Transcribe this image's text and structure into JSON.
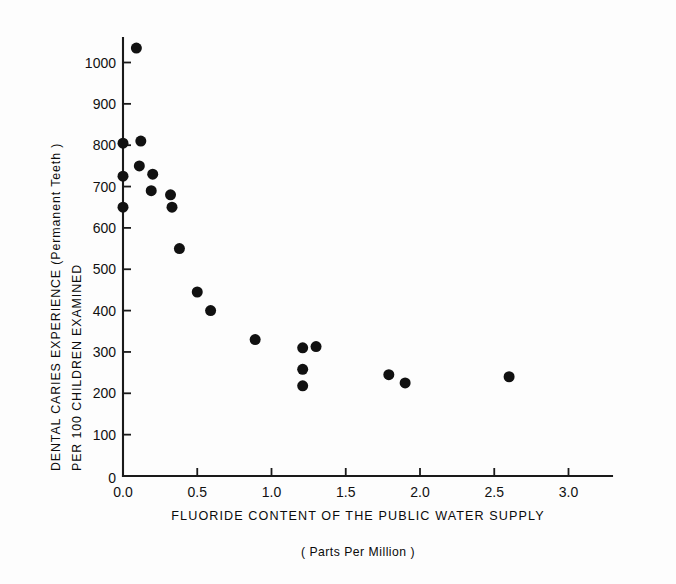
{
  "chart_data": {
    "type": "scatter",
    "title": "",
    "xlabel": "FLUORIDE CONTENT OF THE PUBLIC WATER SUPPLY",
    "xlabel_sub": "( Parts Per Million )",
    "ylabel": "DENTAL CARIES EXPERIENCE (Permanent Teeth )",
    "ylabel_sub": "PER 100 CHILDREN EXAMINED",
    "xlim": [
      0.0,
      3.28
    ],
    "ylim": [
      0,
      1075
    ],
    "grid": false,
    "legend": null,
    "xticks": [
      0.0,
      0.5,
      1.0,
      1.5,
      2.0,
      2.5,
      3.0
    ],
    "xtick_labels": [
      "0.0",
      "0.5",
      "1.0",
      "1.5",
      "2.0",
      "2.5",
      "3.0"
    ],
    "yticks": [
      0,
      100,
      200,
      300,
      400,
      500,
      600,
      700,
      800,
      900,
      1000
    ],
    "ytick_labels": [
      "0",
      "100",
      "200",
      "300",
      "400",
      "500",
      "600",
      "700",
      "800",
      "900",
      "1000"
    ],
    "marker": "filled-circle",
    "marker_color": "#111111",
    "marker_size": 11,
    "x": [
      0.09,
      0.0,
      0.12,
      0.11,
      0.0,
      0.19,
      0.2,
      0.32,
      0.0,
      0.33,
      0.38,
      0.5,
      0.59,
      0.89,
      1.21,
      1.3,
      1.21,
      1.21,
      1.79,
      1.9,
      2.6
    ],
    "y": [
      1035,
      805,
      810,
      750,
      725,
      690,
      730,
      680,
      650,
      650,
      550,
      445,
      400,
      330,
      310,
      313,
      258,
      218,
      245,
      225,
      240
    ],
    "points": [
      {
        "x": 0.09,
        "y": 1035
      },
      {
        "x": 0.0,
        "y": 805
      },
      {
        "x": 0.12,
        "y": 810
      },
      {
        "x": 0.11,
        "y": 750
      },
      {
        "x": 0.0,
        "y": 725
      },
      {
        "x": 0.19,
        "y": 690
      },
      {
        "x": 0.2,
        "y": 730
      },
      {
        "x": 0.32,
        "y": 680
      },
      {
        "x": 0.0,
        "y": 650
      },
      {
        "x": 0.33,
        "y": 650
      },
      {
        "x": 0.38,
        "y": 550
      },
      {
        "x": 0.5,
        "y": 445
      },
      {
        "x": 0.59,
        "y": 400
      },
      {
        "x": 0.89,
        "y": 330
      },
      {
        "x": 1.21,
        "y": 310
      },
      {
        "x": 1.3,
        "y": 313
      },
      {
        "x": 1.21,
        "y": 258
      },
      {
        "x": 1.21,
        "y": 218
      },
      {
        "x": 1.79,
        "y": 245
      },
      {
        "x": 1.9,
        "y": 225
      },
      {
        "x": 2.6,
        "y": 240
      }
    ]
  },
  "axes": {
    "origin_label": "0",
    "axis_color": "#1a1a1a"
  }
}
